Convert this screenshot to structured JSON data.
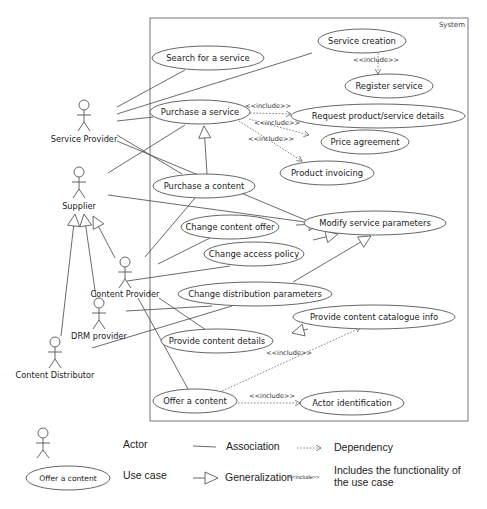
{
  "system": {
    "label": "System",
    "box": {
      "x": 150,
      "y": 18,
      "w": 318,
      "h": 403
    }
  },
  "use_cases": [
    {
      "id": "search",
      "label": "Search for a service",
      "cx": 208,
      "cy": 58,
      "rx": 56,
      "ry": 12
    },
    {
      "id": "service_creation",
      "label": "Service creation",
      "cx": 362,
      "cy": 41,
      "rx": 44,
      "ry": 12
    },
    {
      "id": "register",
      "label": "Register service",
      "cx": 389,
      "cy": 86,
      "rx": 44,
      "ry": 12
    },
    {
      "id": "purchase_service",
      "label": "Purchase a service",
      "cx": 200,
      "cy": 112,
      "rx": 50,
      "ry": 12
    },
    {
      "id": "request_details",
      "label": "Request product/service details",
      "cx": 378,
      "cy": 116,
      "rx": 87,
      "ry": 12
    },
    {
      "id": "price",
      "label": "Price agreement",
      "cx": 365,
      "cy": 142,
      "rx": 44,
      "ry": 12
    },
    {
      "id": "invoicing",
      "label": "Product invoicing",
      "cx": 327,
      "cy": 173,
      "rx": 47,
      "ry": 12
    },
    {
      "id": "purchase_content",
      "label": "Purchase a content",
      "cx": 204,
      "cy": 186,
      "rx": 51,
      "ry": 12
    },
    {
      "id": "change_offer",
      "label": "Change content offer",
      "cx": 230,
      "cy": 227,
      "rx": 49,
      "ry": 12
    },
    {
      "id": "modify_params",
      "label": "Modify service parameters",
      "cx": 375,
      "cy": 223,
      "rx": 71,
      "ry": 12
    },
    {
      "id": "access_policy",
      "label": "Change access policy",
      "cx": 254,
      "cy": 254,
      "rx": 50,
      "ry": 12
    },
    {
      "id": "distribution",
      "label": "Change distribution parameters",
      "cx": 255,
      "cy": 294,
      "rx": 77,
      "ry": 12
    },
    {
      "id": "catalogue",
      "label": "Provide content catalogue info",
      "cx": 374,
      "cy": 317,
      "rx": 81,
      "ry": 12
    },
    {
      "id": "content_details",
      "label": "Provide content details",
      "cx": 217,
      "cy": 341,
      "rx": 56,
      "ry": 12
    },
    {
      "id": "offer_content",
      "label": "Offer a content",
      "cx": 195,
      "cy": 401,
      "rx": 42,
      "ry": 12
    },
    {
      "id": "actor_id",
      "label": "Actor identification",
      "cx": 352,
      "cy": 403,
      "rx": 52,
      "ry": 12
    }
  ],
  "actors": [
    {
      "id": "service_provider",
      "label": "Service Provider",
      "x": 84,
      "y": 105,
      "label_y": 142
    },
    {
      "id": "supplier",
      "label": "Supplier",
      "x": 79,
      "y": 172,
      "label_y": 209
    },
    {
      "id": "content_provider",
      "label": "Content Provider",
      "x": 125,
      "y": 262,
      "label_y": 297
    },
    {
      "id": "drm_provider",
      "label": "DRM provider",
      "x": 99,
      "y": 303,
      "label_y": 339
    },
    {
      "id": "content_distributor",
      "label": "Content Distributor",
      "x": 55,
      "y": 342,
      "label_y": 378
    }
  ],
  "associations": [
    [
      117,
      107,
      185,
      70
    ],
    [
      117,
      114,
      312,
      53
    ],
    [
      117,
      121,
      153,
      117
    ],
    [
      117,
      135,
      182,
      174
    ],
    [
      117,
      141,
      315,
      224
    ],
    [
      108,
      173,
      185,
      125
    ],
    [
      108,
      195,
      305,
      222
    ],
    [
      145,
      257,
      195,
      198
    ],
    [
      158,
      264,
      210,
      238
    ],
    [
      127,
      281,
      230,
      266
    ],
    [
      126,
      311,
      212,
      306
    ],
    [
      92,
      348,
      232,
      306
    ],
    [
      159,
      298,
      206,
      330
    ],
    [
      138,
      298,
      188,
      389
    ]
  ],
  "generalizations": [
    {
      "from": [
        207,
        174
      ],
      "to": [
        204,
        126
      ]
    },
    {
      "from": [
        296,
        225
      ],
      "to": [
        321,
        224
      ]
    },
    {
      "from": [
        313,
        240
      ],
      "to": [
        338,
        234
      ]
    },
    {
      "from": [
        293,
        282
      ],
      "to": [
        371,
        236
      ]
    },
    {
      "from": [
        308,
        329
      ],
      "to": [
        292,
        333
      ],
      "reverse": true
    },
    {
      "from": [
        61,
        336
      ],
      "to": [
        75,
        214
      ]
    },
    {
      "from": [
        96,
        297
      ],
      "to": [
        84,
        214
      ]
    },
    {
      "from": [
        115,
        258
      ],
      "to": [
        93,
        216
      ]
    }
  ],
  "dependencies": [
    {
      "from": [
        378,
        53
      ],
      "to": [
        378,
        74
      ],
      "label": "<<include>>",
      "lx": 376,
      "ly": 62
    },
    {
      "from": [
        250,
        113
      ],
      "to": [
        291,
        114
      ],
      "label": "<<include>>",
      "lx": 268,
      "ly": 108
    },
    {
      "from": [
        249,
        119
      ],
      "to": [
        309,
        135
      ],
      "label": "<<include>>",
      "lx": 277,
      "ly": 125
    },
    {
      "from": [
        239,
        121
      ],
      "to": [
        302,
        161
      ],
      "label": "<<include>>",
      "lx": 271,
      "ly": 141
    },
    {
      "from": [
        222,
        391
      ],
      "to": [
        360,
        328
      ],
      "label": "<<include>>",
      "lx": 289,
      "ly": 355
    },
    {
      "from": [
        238,
        403
      ],
      "to": [
        300,
        403
      ],
      "label": "<<include>>",
      "lx": 272,
      "ly": 398
    }
  ],
  "legend": {
    "actor_label": "Actor",
    "use_case_sample": "Offer a content",
    "use_case_label": "Use case",
    "association_label": "Association",
    "generalization_label": "Generalization",
    "dependency_label": "Dependency",
    "include_stereotype": "<<include>>",
    "include_desc_line1": "Includes the functionality of",
    "include_desc_line2": "the use case"
  }
}
